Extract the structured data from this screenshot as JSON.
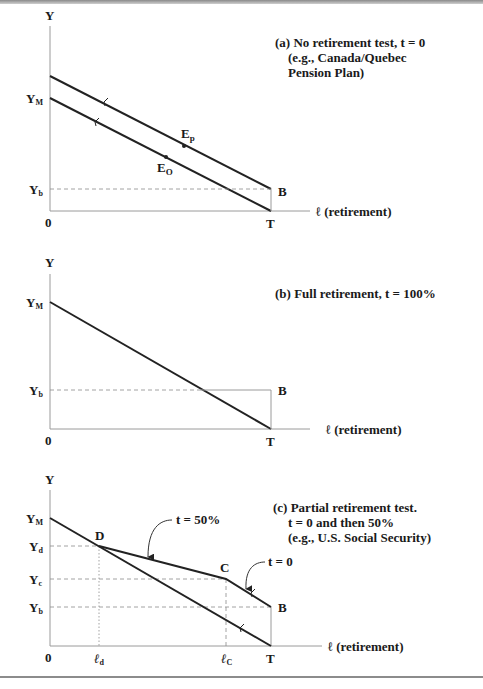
{
  "figure": {
    "panels": [
      {
        "id": "a",
        "caption_lines": [
          "(a) No retirement test, t = 0",
          "(e.g., Canada/Quebec",
          "Pension Plan)"
        ],
        "y_axis_label": "Y",
        "x_axis_label": "ℓ (retirement)",
        "origin_label": "0",
        "y_ticks": [
          {
            "label": "Y",
            "sub": "M"
          },
          {
            "label": "Y",
            "sub": "b"
          }
        ],
        "x_ticks": [
          {
            "label": "T"
          }
        ],
        "points": [
          {
            "label": "B"
          },
          {
            "label": "E",
            "sub": "p"
          },
          {
            "label": "E",
            "sub": "O"
          }
        ]
      },
      {
        "id": "b",
        "caption_lines": [
          "(b) Full retirement, t = 100%"
        ],
        "y_axis_label": "Y",
        "x_axis_label": "ℓ (retirement)",
        "origin_label": "0",
        "y_ticks": [
          {
            "label": "Y",
            "sub": "M"
          },
          {
            "label": "Y",
            "sub": "b"
          }
        ],
        "x_ticks": [
          {
            "label": "T"
          }
        ],
        "points": [
          {
            "label": "B"
          }
        ]
      },
      {
        "id": "c",
        "caption_lines": [
          "(c) Partial retirement test.",
          "t = 0 and then 50%",
          "(e.g., U.S. Social Security)"
        ],
        "y_axis_label": "Y",
        "x_axis_label": "ℓ (retirement)",
        "origin_label": "0",
        "y_ticks": [
          {
            "label": "Y",
            "sub": "M"
          },
          {
            "label": "Y",
            "sub": "d"
          },
          {
            "label": "Y",
            "sub": "c"
          },
          {
            "label": "Y",
            "sub": "b"
          }
        ],
        "x_ticks": [
          {
            "label": "ℓ",
            "sub": "d"
          },
          {
            "label": "ℓ",
            "sub": "C"
          },
          {
            "label": "T"
          }
        ],
        "points": [
          {
            "label": "D"
          },
          {
            "label": "C"
          },
          {
            "label": "B"
          }
        ],
        "annotations": [
          {
            "text": "t = 50%"
          },
          {
            "text": "t = 0"
          }
        ]
      }
    ]
  }
}
